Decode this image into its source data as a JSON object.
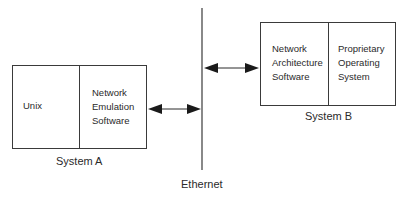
{
  "diagram": {
    "network": {
      "label": "Ethernet"
    },
    "system_a": {
      "label": "System A",
      "left_cell": "Unix",
      "right_cell": "Network\nEmulation\nSoftware"
    },
    "system_b": {
      "label": "System B",
      "left_cell": "Network\nArchitecture\nSoftware",
      "right_cell": "Proprietary\nOperating\nSystem"
    },
    "connections": [
      {
        "from": "System A",
        "to": "Ethernet",
        "type": "bidirectional-arrow"
      },
      {
        "from": "Ethernet",
        "to": "System B",
        "type": "bidirectional-arrow"
      }
    ],
    "colors": {
      "line": "#3a3a3a",
      "text": "#2a2a2a",
      "background": "#ffffff"
    }
  }
}
